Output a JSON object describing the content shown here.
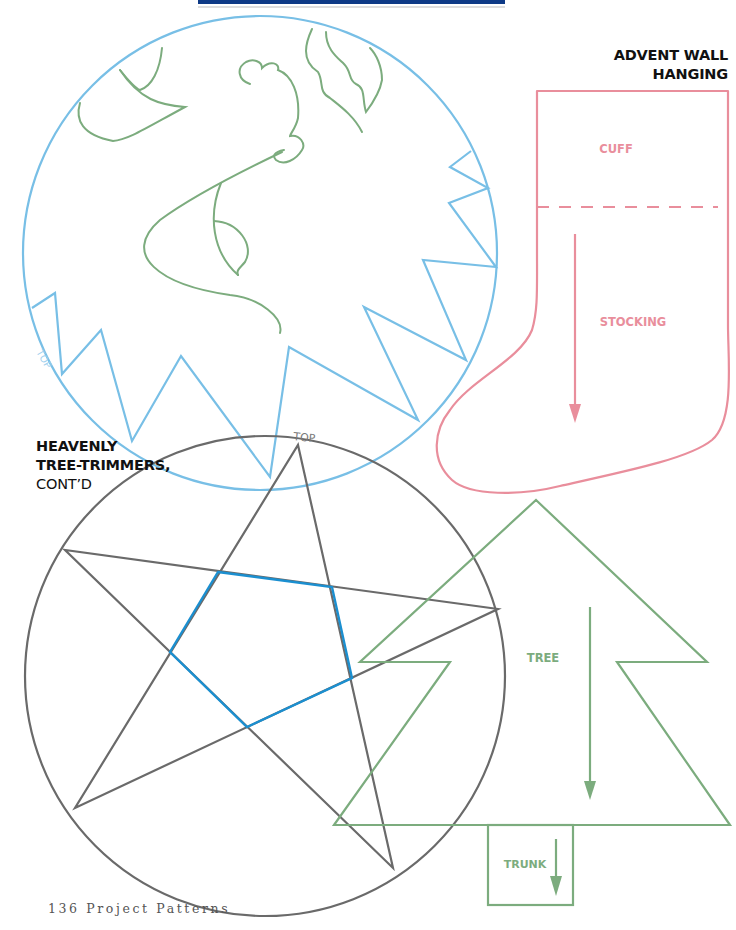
{
  "header_bar": {
    "color": "#0e3a86"
  },
  "colors": {
    "blue": "#78bfe6",
    "green": "#7cac7e",
    "pink": "#e98e9c",
    "gray": "#6a6a6a",
    "star_inner": "#1b8fd0",
    "text": "#111111"
  },
  "advent_title": {
    "line1": "ADVENT WALL",
    "line2": "HANGING"
  },
  "heavenly_title": {
    "line1": "HEAVENLY",
    "line2": "TREE-TRIMMERS,",
    "line3": "CONT’D"
  },
  "stocking": {
    "cuff_label": "CUFF",
    "stocking_label": "STOCKING"
  },
  "tree": {
    "tree_label": "TREE",
    "trunk_label": "TRUNK"
  },
  "angel_circle": {
    "top_label": "TOP"
  },
  "star_circle": {
    "top_label": "TOP"
  },
  "footer": {
    "page_text": "136 Project Patterns"
  }
}
